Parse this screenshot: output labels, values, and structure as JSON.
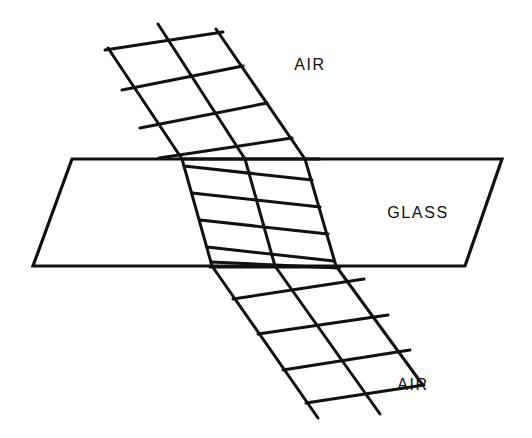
{
  "figure": {
    "background_color": "#ffffff",
    "stroke_color": "#111111",
    "labels": [
      {
        "id": "air-top",
        "text": "AIR",
        "x": 310,
        "y": 70,
        "anchor": "middle"
      },
      {
        "id": "glass",
        "text": "GLASS",
        "x": 418,
        "y": 218,
        "anchor": "middle"
      },
      {
        "id": "air-bottom",
        "text": "AIR",
        "x": 413,
        "y": 390,
        "anchor": "middle"
      }
    ],
    "slab": {
      "name": "glass-slab",
      "top_surface_y": 159,
      "bottom_surface_y": 266,
      "points": "72,159 502,159 465,266 33,266",
      "stroke_width": 3.2,
      "fill": "none"
    },
    "beams": {
      "incident": {
        "name": "incident-beam",
        "medium": "AIR",
        "ray_angle_deg": 44,
        "wavefront_spacing_px": 52,
        "stroke_width": 3.0,
        "rays": [
          {
            "x1": 108,
            "y1": 48,
            "x2": 182,
            "y2": 159
          },
          {
            "x1": 158,
            "y1": 24,
            "x2": 245,
            "y2": 159
          },
          {
            "x1": 216,
            "y1": 29,
            "x2": 305,
            "y2": 159
          }
        ],
        "wavefronts": [
          {
            "x1": 105,
            "y1": 50,
            "x2": 223,
            "y2": 32
          },
          {
            "x1": 122,
            "y1": 90,
            "x2": 243,
            "y2": 66
          },
          {
            "x1": 140,
            "y1": 128,
            "x2": 267,
            "y2": 103
          },
          {
            "x1": 159,
            "y1": 158,
            "x2": 292,
            "y2": 138
          },
          {
            "x1": 182,
            "y1": 159,
            "x2": 319,
            "y2": 159
          }
        ]
      },
      "refracted_internal": {
        "name": "refracted-beam-in-glass",
        "medium": "GLASS",
        "ray_angle_deg": 16,
        "wavefront_spacing_px": 27,
        "stroke_width": 3.0,
        "rays": [
          {
            "x1": 182,
            "y1": 159,
            "x2": 212,
            "y2": 266
          },
          {
            "x1": 245,
            "y1": 159,
            "x2": 275,
            "y2": 266
          },
          {
            "x1": 305,
            "y1": 159,
            "x2": 336,
            "y2": 266
          }
        ],
        "wavefronts": [
          {
            "x1": 184,
            "y1": 166,
            "x2": 312,
            "y2": 180
          },
          {
            "x1": 192,
            "y1": 193,
            "x2": 320,
            "y2": 207
          },
          {
            "x1": 200,
            "y1": 220,
            "x2": 328,
            "y2": 234
          },
          {
            "x1": 207,
            "y1": 247,
            "x2": 334,
            "y2": 261
          },
          {
            "x1": 211,
            "y1": 262,
            "x2": 339,
            "y2": 268
          }
        ]
      },
      "emergent": {
        "name": "emergent-beam",
        "medium": "AIR",
        "ray_angle_deg": 44,
        "wavefront_spacing_px": 52,
        "stroke_width": 3.0,
        "rays": [
          {
            "x1": 212,
            "y1": 266,
            "x2": 318,
            "y2": 418
          },
          {
            "x1": 275,
            "y1": 266,
            "x2": 380,
            "y2": 414
          },
          {
            "x1": 336,
            "y1": 266,
            "x2": 422,
            "y2": 384
          }
        ],
        "wavefronts": [
          {
            "x1": 210,
            "y1": 267,
            "x2": 340,
            "y2": 267
          },
          {
            "x1": 233,
            "y1": 299,
            "x2": 364,
            "y2": 279
          },
          {
            "x1": 258,
            "y1": 334,
            "x2": 388,
            "y2": 315
          },
          {
            "x1": 283,
            "y1": 370,
            "x2": 410,
            "y2": 350
          },
          {
            "x1": 306,
            "y1": 403,
            "x2": 424,
            "y2": 385
          }
        ]
      }
    }
  }
}
